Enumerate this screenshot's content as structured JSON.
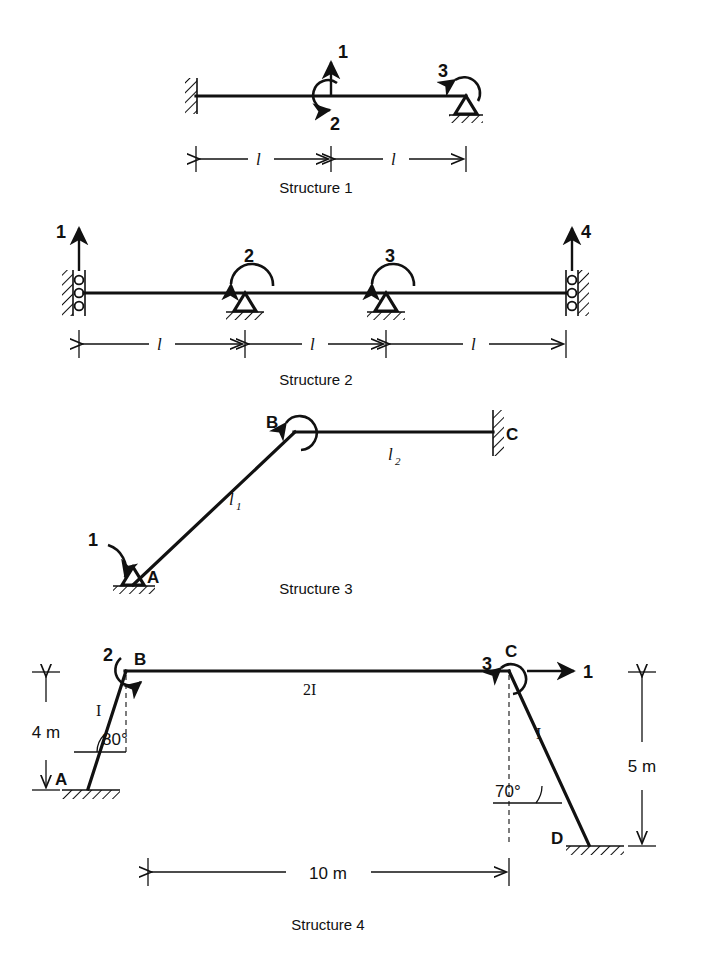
{
  "figure": {
    "background_color": "#ffffff",
    "ink_color": "#111111"
  },
  "structures": [
    {
      "caption": "Structure 1",
      "type": "propped-cantilever-beam",
      "supports": [
        {
          "name": "left-fixed-wall",
          "kind": "fixed-wall",
          "position": "left-end"
        },
        {
          "name": "right-pin",
          "kind": "pin-hatched-ground",
          "position": "right-end"
        }
      ],
      "actions": [
        {
          "id": "1",
          "kind": "force-vertical-up",
          "location": "midspan"
        },
        {
          "id": "2",
          "kind": "moment-arc",
          "location": "midspan"
        },
        {
          "id": "3",
          "kind": "moment-arc",
          "location": "right-support"
        }
      ],
      "dimensions": [
        {
          "label": "l",
          "span": "left-half"
        },
        {
          "label": "l",
          "span": "right-half"
        }
      ]
    },
    {
      "caption": "Structure 2",
      "type": "continuous-beam-three-spans",
      "supports": [
        {
          "name": "left-guided-roller",
          "kind": "guided-roller-wall",
          "position": "left-end"
        },
        {
          "name": "interior-pin-1",
          "kind": "pin-hatched-ground",
          "position": "one-third"
        },
        {
          "name": "interior-pin-2",
          "kind": "pin-hatched-ground",
          "position": "two-thirds"
        },
        {
          "name": "right-guided-roller",
          "kind": "guided-roller-wall",
          "position": "right-end"
        }
      ],
      "actions": [
        {
          "id": "1",
          "kind": "force-vertical-up",
          "location": "left-end"
        },
        {
          "id": "2",
          "kind": "moment-arc",
          "location": "interior-pin-1"
        },
        {
          "id": "3",
          "kind": "moment-arc",
          "location": "interior-pin-2"
        },
        {
          "id": "4",
          "kind": "force-vertical-up",
          "location": "right-end"
        }
      ],
      "dimensions": [
        {
          "label": "l",
          "span": "span-1"
        },
        {
          "label": "l",
          "span": "span-2"
        },
        {
          "label": "l",
          "span": "span-3"
        }
      ]
    },
    {
      "caption": "Structure 3",
      "type": "two-member-bent-frame",
      "joints": [
        {
          "label": "A",
          "kind": "pin-hatched-ground"
        },
        {
          "label": "B",
          "kind": "rigid-joint"
        },
        {
          "label": "C",
          "kind": "fixed-wall"
        }
      ],
      "members": [
        {
          "label": "l",
          "subscript": "1",
          "from": "A",
          "to": "B"
        },
        {
          "label": "l",
          "subscript": "2",
          "from": "B",
          "to": "C"
        }
      ],
      "actions": [
        {
          "id": "1",
          "kind": "moment-arc",
          "location": "A"
        },
        {
          "id": "",
          "kind": "moment-arc",
          "location": "B"
        }
      ]
    },
    {
      "caption": "Structure 4",
      "type": "gabled-portal-frame",
      "joints": [
        {
          "label": "A",
          "kind": "fixed-base"
        },
        {
          "label": "B",
          "kind": "rigid-joint"
        },
        {
          "label": "C",
          "kind": "rigid-joint"
        },
        {
          "label": "D",
          "kind": "fixed-base"
        }
      ],
      "members": [
        {
          "name": "left-column",
          "stiffness": "I",
          "from": "A",
          "to": "B"
        },
        {
          "name": "beam",
          "stiffness": "2I",
          "from": "B",
          "to": "C"
        },
        {
          "name": "right-column",
          "stiffness": "I",
          "from": "C",
          "to": "D"
        }
      ],
      "angles": [
        {
          "label": "80°",
          "at": "left-column-base"
        },
        {
          "label": "70°",
          "at": "right-column-base"
        }
      ],
      "dimensions": [
        {
          "label": "4 m",
          "orientation": "vertical",
          "side": "left"
        },
        {
          "label": "5 m",
          "orientation": "vertical",
          "side": "right"
        },
        {
          "label": "10 m",
          "orientation": "horizontal",
          "side": "bottom"
        }
      ],
      "actions": [
        {
          "id": "1",
          "kind": "force-horizontal-right",
          "location": "C"
        },
        {
          "id": "2",
          "kind": "moment-arc",
          "location": "B"
        },
        {
          "id": "3",
          "kind": "moment-arc",
          "location": "C"
        }
      ]
    }
  ],
  "captions": {
    "s1": "Structure 1",
    "s2": "Structure 2",
    "s3": "Structure 3",
    "s4": "Structure 4"
  },
  "labels": {
    "n1": "1",
    "n2": "2",
    "n3": "3",
    "n4": "4",
    "ell": "l",
    "sub1": "1",
    "sub2": "2",
    "A": "A",
    "B": "B",
    "C": "C",
    "D": "D",
    "I": "I",
    "twoI": "2I",
    "ang80": "80°",
    "ang70": "70°",
    "d4m": "4 m",
    "d5m": "5 m",
    "d10m": "10 m"
  }
}
